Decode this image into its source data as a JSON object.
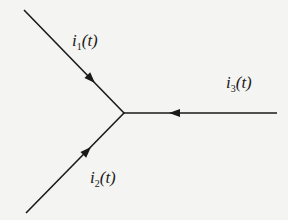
{
  "diagram": {
    "title": "",
    "node": {
      "name": "junction"
    },
    "branches": [
      {
        "id": "i1",
        "label_main": "i",
        "label_sub": "1",
        "label_arg": "(t)",
        "direction": "into-node"
      },
      {
        "id": "i2",
        "label_main": "i",
        "label_sub": "2",
        "label_arg": "(t)",
        "direction": "into-node"
      },
      {
        "id": "i3",
        "label_main": "i",
        "label_sub": "3",
        "label_arg": "(t)",
        "direction": "into-node"
      }
    ],
    "colors": {
      "line": "#1a1a1a",
      "background": "#f4f4f2"
    }
  }
}
